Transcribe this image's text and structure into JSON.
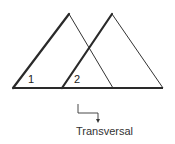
{
  "diagram": {
    "type": "parallel-lines-transversal",
    "angle_labels": [
      "1",
      "2"
    ],
    "caption": "Transversal",
    "colors": {
      "line": "#2a2a2a",
      "text": "#333333",
      "background": "#ffffff"
    }
  }
}
